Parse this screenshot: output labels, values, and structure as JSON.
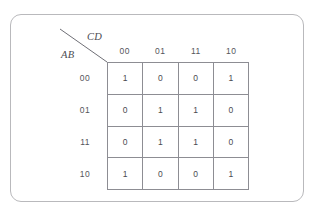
{
  "figure": {
    "type": "karnaugh-map",
    "row_variable_label": "AB",
    "col_variable_label": "CD",
    "col_headers": [
      "00",
      "01",
      "11",
      "10"
    ],
    "row_headers": [
      "00",
      "01",
      "11",
      "10"
    ],
    "cells": [
      [
        "1",
        "0",
        "0",
        "1"
      ],
      [
        "0",
        "1",
        "1",
        "0"
      ],
      [
        "0",
        "1",
        "1",
        "0"
      ],
      [
        "1",
        "0",
        "0",
        "1"
      ]
    ],
    "colors": {
      "background": "#ffffff",
      "card_border": "#b9b9bc",
      "grid_line": "#8d8d93",
      "text": "#4a4a50",
      "header_text": "#55555b",
      "axis_label_text": "#4c4c52",
      "diagonal_line": "#6f6f76"
    }
  }
}
